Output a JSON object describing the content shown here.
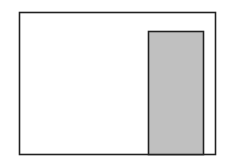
{
  "diagram": {
    "background": "#ffffff",
    "stroke_color": "#222222",
    "outer_rect": {
      "x": 19.5,
      "y": 12.5,
      "width": 196,
      "height": 142,
      "fill": "#ffffff"
    },
    "inner_rect": {
      "x": 148.5,
      "y": 31.5,
      "width": 55,
      "height": 123,
      "fill": "#c0c0c0"
    }
  }
}
